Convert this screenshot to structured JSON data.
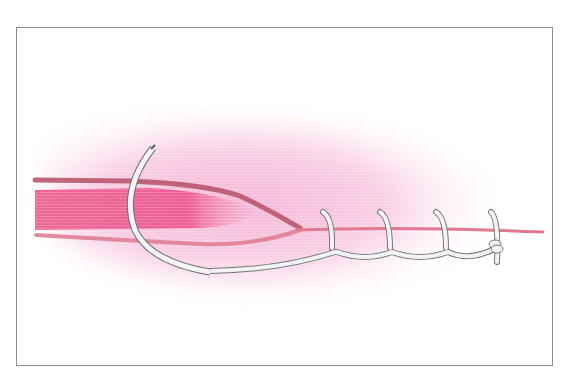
{
  "figure": {
    "colors": {
      "frame_border": "#8a8a8e",
      "background": "#ffffff",
      "tissue_haze": "#f7c0dc",
      "tissue_core": "#ec5f92",
      "upper_edge": "#b8566f",
      "lower_edge": "#de7e96",
      "suture": "#f2f2f2",
      "suture_outline": "#7a7a80",
      "needle": "#f4f4f4"
    },
    "elements": {
      "needle": "curved-surgical-needle",
      "suture": "continuous-running-suture",
      "stitch_count": 4,
      "knot": "terminal-knot"
    }
  }
}
